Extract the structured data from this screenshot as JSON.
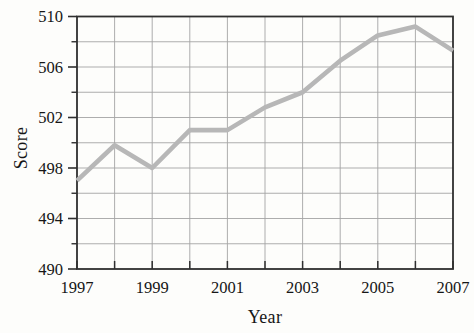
{
  "chart_data": {
    "type": "line",
    "title": "",
    "xlabel": "Year",
    "ylabel": "Score",
    "x": [
      1997,
      1998,
      1999,
      2000,
      2001,
      2002,
      2003,
      2004,
      2005,
      2006,
      2007
    ],
    "values": [
      497,
      499.8,
      498,
      501,
      501,
      502.8,
      504,
      506.5,
      508.5,
      509.2,
      507.3
    ],
    "series": [
      {
        "name": "Score",
        "values": [
          497,
          499.8,
          498,
          501,
          501,
          502.8,
          504,
          506.5,
          508.5,
          509.2,
          507.3
        ]
      }
    ],
    "xlim": [
      1997,
      2007
    ],
    "ylim": [
      490,
      510
    ],
    "x_labeled_years": [
      1997,
      1999,
      2001,
      2003,
      2005,
      2007
    ],
    "x_tick_labels": [
      "1997",
      "1999",
      "2001",
      "2003",
      "2005",
      "2007"
    ],
    "y_major_ticks": [
      490,
      494,
      498,
      502,
      506,
      510
    ],
    "y_tick_labels": [
      "490",
      "494",
      "498",
      "502",
      "506",
      "510"
    ],
    "y_minor_ticks": [
      492,
      496,
      500,
      504,
      508
    ],
    "grid": true,
    "legend": "none",
    "colors": {
      "line": "#b7b7b7",
      "grid": "#a4a4a4",
      "axis": "#2f2f2f",
      "text": "#161616",
      "background": "#fdfdfb"
    }
  }
}
